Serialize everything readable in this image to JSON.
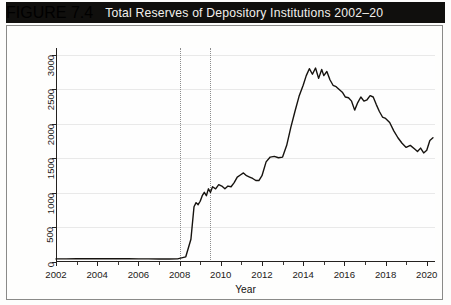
{
  "header": {
    "figure_number": "FIGURE 7.4",
    "title": "Total Reserves of Depository Institutions 2002–20",
    "band_color": "#100f0d",
    "text_color": "#f2f0ec"
  },
  "chart_data": {
    "type": "line",
    "title": "Total Reserves of Depository Institutions 2002–20",
    "xlabel": "Year",
    "ylabel": "Billions (December 2015 $)",
    "xlim": [
      2002,
      2020.4
    ],
    "ylim": [
      0,
      3100
    ],
    "yticks": [
      0,
      500,
      1000,
      1500,
      2000,
      2500,
      3000
    ],
    "ytick_labels": [
      "0",
      "500",
      "1000",
      "1500",
      "2000",
      "2500",
      "3000"
    ],
    "xticks": [
      2002,
      2004,
      2006,
      2008,
      2010,
      2012,
      2014,
      2016,
      2018,
      2020
    ],
    "xtick_labels": [
      "2002",
      "2004",
      "2006",
      "2008",
      "2010",
      "2012",
      "2014",
      "2016",
      "2018",
      "2020"
    ],
    "x_minor_ticks": [
      2003,
      2005,
      2007,
      2009,
      2011,
      2013,
      2015,
      2017,
      2019
    ],
    "grid": "horizontal",
    "legend": "none",
    "line_color": "#16130f",
    "line_width": 1.4,
    "annotations": [
      {
        "name": "recession-start",
        "type": "vertical-dotted-line",
        "x": 2008.0,
        "color": "#8d8d8d"
      },
      {
        "name": "recession-end",
        "type": "vertical-dotted-line",
        "x": 2009.5,
        "color": "#8d8d8d"
      }
    ],
    "series": [
      {
        "name": "Total Reserves",
        "x": [
          2002.0,
          2002.5,
          2003.0,
          2003.5,
          2004.0,
          2004.5,
          2005.0,
          2005.5,
          2006.0,
          2006.5,
          2007.0,
          2007.5,
          2007.9,
          2008.1,
          2008.3,
          2008.55,
          2008.7,
          2008.8,
          2008.9,
          2009.0,
          2009.1,
          2009.2,
          2009.3,
          2009.4,
          2009.5,
          2009.6,
          2009.75,
          2009.9,
          2010.05,
          2010.2,
          2010.35,
          2010.5,
          2010.65,
          2010.8,
          2010.95,
          2011.1,
          2011.25,
          2011.4,
          2011.55,
          2011.7,
          2011.85,
          2012.0,
          2012.2,
          2012.4,
          2012.6,
          2012.8,
          2013.0,
          2013.2,
          2013.4,
          2013.6,
          2013.8,
          2014.0,
          2014.15,
          2014.3,
          2014.45,
          2014.6,
          2014.75,
          2014.9,
          2015.0,
          2015.15,
          2015.3,
          2015.45,
          2015.6,
          2015.75,
          2015.9,
          2016.05,
          2016.2,
          2016.35,
          2016.5,
          2016.65,
          2016.8,
          2016.95,
          2017.1,
          2017.25,
          2017.4,
          2017.55,
          2017.7,
          2017.85,
          2018.0,
          2018.2,
          2018.4,
          2018.6,
          2018.8,
          2019.0,
          2019.2,
          2019.4,
          2019.55,
          2019.7,
          2019.85,
          2020.0,
          2020.15,
          2020.3
        ],
        "y": [
          45,
          45,
          48,
          47,
          48,
          47,
          46,
          46,
          45,
          45,
          44,
          43,
          45,
          60,
          75,
          330,
          800,
          860,
          830,
          880,
          960,
          1010,
          960,
          1060,
          1010,
          1090,
          1060,
          1120,
          1100,
          1060,
          1100,
          1090,
          1150,
          1230,
          1260,
          1290,
          1250,
          1230,
          1210,
          1180,
          1180,
          1250,
          1450,
          1520,
          1530,
          1510,
          1520,
          1690,
          1950,
          2180,
          2400,
          2560,
          2700,
          2800,
          2720,
          2810,
          2660,
          2790,
          2700,
          2760,
          2640,
          2560,
          2540,
          2500,
          2460,
          2390,
          2380,
          2330,
          2200,
          2310,
          2390,
          2330,
          2350,
          2410,
          2390,
          2280,
          2180,
          2100,
          2080,
          2020,
          1900,
          1800,
          1720,
          1660,
          1690,
          1640,
          1600,
          1650,
          1580,
          1620,
          1760,
          1800
        ]
      }
    ]
  }
}
